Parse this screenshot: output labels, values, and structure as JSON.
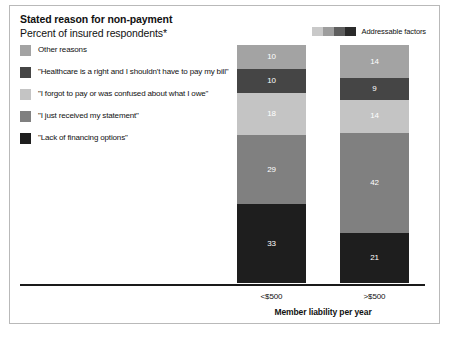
{
  "header": {
    "title": "Stated reason for non-payment",
    "subtitle": "Percent of insured respondents*"
  },
  "addressable_legend": {
    "label": "Addressable factors",
    "gradient": [
      "#c9c9c9",
      "#9d9d9d",
      "#5e5e5e",
      "#2b2b2b"
    ]
  },
  "chart_data": {
    "type": "bar",
    "subtype": "stacked-column",
    "title": "Stated reason for non-payment",
    "subtitle": "Percent of insured respondents*",
    "xlabel": "Member liability per year",
    "ylabel": "",
    "ylim": [
      0,
      100
    ],
    "grid": false,
    "legend_position": "top-left",
    "categories": [
      "<$500",
      ">$500"
    ],
    "stack_order_top_to_bottom": [
      "Other reasons",
      "\"Healthcare is a right and I shouldn't have to pay my bill\"",
      "\"I forgot to pay or was confused about what I owe\"",
      "\"I just received my statement\"",
      "\"Lack of financing options\""
    ],
    "series": [
      {
        "name": "Other reasons",
        "color": "#a3a3a3",
        "values": [
          10,
          14
        ]
      },
      {
        "name": "\"Healthcare is a right and I shouldn't have to pay my bill\"",
        "color": "#454545",
        "values": [
          10,
          9
        ]
      },
      {
        "name": "\"I forgot to pay or was confused about what I owe\"",
        "color": "#c4c4c4",
        "values": [
          18,
          14
        ]
      },
      {
        "name": "\"I just received my statement\"",
        "color": "#808080",
        "values": [
          29,
          42
        ]
      },
      {
        "name": "\"Lack of financing options\"",
        "color": "#1e1e1e",
        "values": [
          33,
          21
        ]
      }
    ]
  }
}
